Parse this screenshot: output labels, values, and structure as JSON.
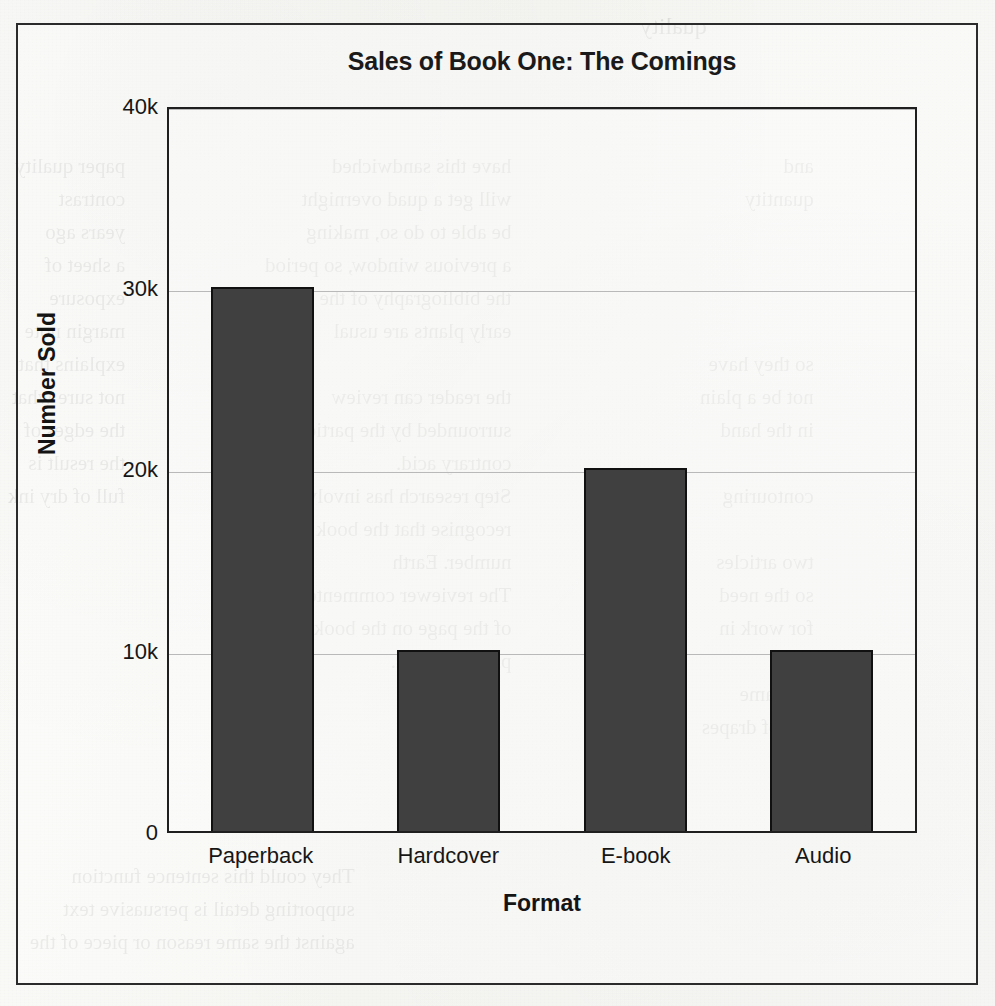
{
  "chart_data": {
    "type": "bar",
    "title": "Sales of Book One: The Comings",
    "xlabel": "Format",
    "ylabel": "Number Sold",
    "categories": [
      "Paperback",
      "Hardcover",
      "E-book",
      "Audio"
    ],
    "values": [
      30000,
      10000,
      20000,
      10000
    ],
    "ytick_labels": [
      "0",
      "10k",
      "20k",
      "30k",
      "40k"
    ],
    "ytick_values": [
      0,
      10000,
      20000,
      30000,
      40000
    ],
    "ylim": [
      0,
      40000
    ],
    "grid": true,
    "legend": "none",
    "bar_color": "#404040",
    "bar_edge_color": "#111111",
    "gridline_color": "#b9b9b9",
    "axis_color": "#1f1f1f"
  },
  "page": {
    "frame_color": "#2b2b2b",
    "background_color": "#f7f7f5",
    "bleed_through": {
      "left": "paper quality\ncontrast\nyears ago\na sheet of\nexposure\nmargin note\nexplains that\nnot sure what\nthe edges of\nthe result is\nfull of dry ink",
      "middle": "have this sandwiched\nwill get a quad overnight\nbe able to do so, making\na previous window, so period\nthe bibliography of the sun\nearly plants are usual\n\nthe reader can review\nsurrounded by the particular\ncontrary acid.\nStep research has involved\nrecognise that the book has been\nnumber. Earth\nThe reviewer commented in\nof the page on the book. Despite\nplants and etc.",
      "right": "and\nquantity\n\n\n\n\nso they have\nnot be a plain\nin the hand\n\ncontouring\n\ntwo articles\nso the need\nfor work in\n\nthe same\nfull of drapes",
      "bottom": "They could this sentence function\nsupporting detail is persuasive text\nagainst the same reason or piece of the",
      "top": "quality"
    }
  }
}
